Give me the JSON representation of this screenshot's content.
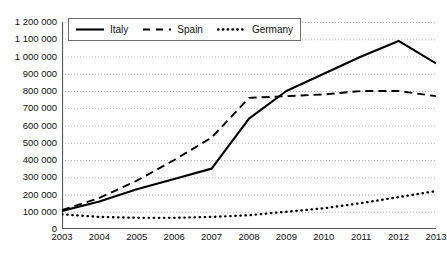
{
  "chart_data": {
    "type": "line",
    "title": "",
    "xlabel": "",
    "ylabel": "",
    "categories": [
      "2003",
      "2004",
      "2005",
      "2006",
      "2007",
      "2008",
      "2009",
      "2010",
      "2011",
      "2012",
      "2013"
    ],
    "x": [
      2003,
      2004,
      2005,
      2006,
      2007,
      2008,
      2009,
      2010,
      2011,
      2012,
      2013
    ],
    "ylim": [
      0,
      1200000
    ],
    "xlim": [
      2003,
      2013
    ],
    "grid": true,
    "grid_style": "dotted-horizontal",
    "legend_position": "top-left-inside",
    "y_tick_step": 100000,
    "y_tick_labels": [
      "1 200 000",
      "1 100 000",
      "1 000 000",
      "900 000",
      "800 000",
      "700 000",
      "600 000",
      "500 000",
      "400 000",
      "300 000",
      "200 000",
      "100 000",
      "0"
    ],
    "y_tick_values": [
      1200000,
      1100000,
      1000000,
      900000,
      800000,
      700000,
      600000,
      500000,
      400000,
      300000,
      200000,
      100000,
      0
    ],
    "series": [
      {
        "name": "Italy",
        "style": "solid",
        "color": "#000000",
        "width": 2.1,
        "values": [
          105000,
          160000,
          230000,
          290000,
          350000,
          640000,
          800000,
          900000,
          1000000,
          1090000,
          960000
        ]
      },
      {
        "name": "Spain",
        "style": "dashed",
        "color": "#000000",
        "width": 1.9,
        "values": [
          110000,
          180000,
          280000,
          400000,
          530000,
          760000,
          770000,
          780000,
          800000,
          800000,
          770000
        ]
      },
      {
        "name": "Germany",
        "style": "dotted",
        "color": "#000000",
        "width": 2.3,
        "values": [
          85000,
          70000,
          65000,
          65000,
          70000,
          80000,
          100000,
          120000,
          150000,
          185000,
          220000
        ]
      }
    ]
  },
  "legend": {
    "items": [
      {
        "label": "Italy",
        "icon": "solid-line-icon"
      },
      {
        "label": "Spain",
        "icon": "dashed-line-icon"
      },
      {
        "label": "Germany",
        "icon": "dotted-line-icon"
      }
    ]
  },
  "colors": {
    "axis": "#595959",
    "grid": "#b9b9b9",
    "series": "#000000",
    "legend_border": "#6e6e6e",
    "background": "#ffffff"
  }
}
